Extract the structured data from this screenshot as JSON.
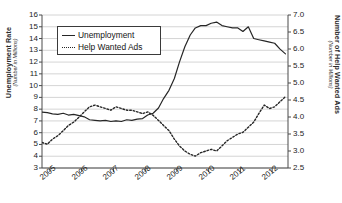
{
  "chart_data": {
    "type": "line",
    "title": "",
    "xlabel": "",
    "ylabel": "Unemployment Rate",
    "ylabel_sub": "(Number in Millions)",
    "y2label": "Number of Help Wanted Ads",
    "y2label_sub": "(Number in Millions)",
    "grid": true,
    "legend_position": "upper-left-inside",
    "ylim": [
      3,
      16
    ],
    "y2lim": [
      2.5,
      7.0
    ],
    "yticks": [
      3,
      4,
      5,
      6,
      7,
      8,
      9,
      10,
      11,
      12,
      13,
      14,
      15,
      16
    ],
    "y2ticks": [
      "2.5",
      "3.0",
      "3.5",
      "4.0",
      "4.5",
      "5.0",
      "5.5",
      "6.0",
      "6.5",
      "7.0"
    ],
    "xlim": [
      2004.75,
      2012.5
    ],
    "xticks": [
      2005,
      2006,
      2007,
      2008,
      2009,
      2010,
      2011,
      2012
    ],
    "xtick_labels": [
      "2005",
      "2006",
      "2007",
      "2008",
      "2009",
      "2010",
      "2011",
      "2012"
    ],
    "series": [
      {
        "name": "Unemployment",
        "axis": "left",
        "style": "solid",
        "color": "#262626",
        "x": [
          2004.75,
          2004.92,
          2005.08,
          2005.25,
          2005.42,
          2005.58,
          2005.75,
          2005.92,
          2006.08,
          2006.25,
          2006.42,
          2006.58,
          2006.75,
          2006.92,
          2007.08,
          2007.25,
          2007.42,
          2007.58,
          2007.75,
          2007.92,
          2008.08,
          2008.25,
          2008.42,
          2008.58,
          2008.75,
          2008.92,
          2009.08,
          2009.25,
          2009.42,
          2009.58,
          2009.75,
          2009.92,
          2010.08,
          2010.25,
          2010.42,
          2010.58,
          2010.75,
          2010.92,
          2011.08,
          2011.25,
          2011.42,
          2011.58,
          2011.75,
          2011.92,
          2012.08,
          2012.25,
          2012.42
        ],
        "y": [
          7.75,
          7.7,
          7.6,
          7.55,
          7.65,
          7.5,
          7.55,
          7.45,
          7.35,
          7.1,
          7.05,
          7.0,
          7.05,
          6.95,
          7.0,
          6.95,
          7.1,
          7.05,
          7.15,
          7.2,
          7.5,
          7.65,
          8.1,
          8.9,
          9.6,
          10.6,
          12.0,
          13.3,
          14.3,
          14.9,
          15.1,
          15.1,
          15.3,
          15.4,
          15.1,
          15.0,
          14.9,
          14.9,
          14.6,
          15.0,
          14.0,
          13.9,
          13.8,
          13.7,
          13.6,
          13.1,
          12.7
        ]
      },
      {
        "name": "Help Wanted Ads",
        "axis": "right",
        "style": "dashed",
        "color": "#262626",
        "x": [
          2004.75,
          2004.92,
          2005.08,
          2005.25,
          2005.42,
          2005.58,
          2005.75,
          2005.92,
          2006.08,
          2006.25,
          2006.42,
          2006.58,
          2006.75,
          2006.92,
          2007.08,
          2007.25,
          2007.42,
          2007.58,
          2007.75,
          2007.92,
          2008.08,
          2008.25,
          2008.42,
          2008.58,
          2008.75,
          2008.92,
          2009.08,
          2009.25,
          2009.42,
          2009.58,
          2009.75,
          2009.92,
          2010.08,
          2010.25,
          2010.42,
          2010.58,
          2010.75,
          2010.92,
          2011.08,
          2011.25,
          2011.42,
          2011.58,
          2011.75,
          2011.92,
          2012.08,
          2012.25,
          2012.42
        ],
        "y": [
          3.25,
          3.2,
          3.35,
          3.45,
          3.6,
          3.75,
          3.85,
          4.0,
          4.15,
          4.3,
          4.35,
          4.3,
          4.25,
          4.2,
          4.3,
          4.25,
          4.2,
          4.2,
          4.15,
          4.1,
          4.15,
          4.05,
          3.9,
          3.75,
          3.6,
          3.35,
          3.15,
          3.0,
          2.9,
          2.85,
          2.95,
          3.0,
          3.05,
          3.0,
          3.15,
          3.3,
          3.4,
          3.5,
          3.55,
          3.7,
          3.85,
          4.1,
          4.35,
          4.25,
          4.3,
          4.45,
          4.6
        ]
      }
    ]
  },
  "legend": {
    "items": [
      {
        "label": "Unemployment",
        "style": "solid"
      },
      {
        "label": "Help Wanted Ads",
        "style": "dashed"
      }
    ]
  }
}
